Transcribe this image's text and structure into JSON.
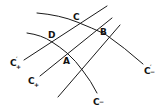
{
  "diagram": {
    "stroke_color": "#1a1a1a",
    "background": "#ffffff",
    "points": [
      {
        "id": "C",
        "label": "C"
      },
      {
        "id": "B",
        "label": "B"
      },
      {
        "id": "D",
        "label": "D"
      },
      {
        "id": "A",
        "label": "A"
      }
    ],
    "curves": [
      {
        "id": "c-prime-plus",
        "label": "C",
        "prime": "′",
        "sub": "+"
      },
      {
        "id": "c-plus",
        "label": "C",
        "prime": "",
        "sub": "+"
      },
      {
        "id": "c-prime-minus",
        "label": "C",
        "prime": "′",
        "sub": "−"
      },
      {
        "id": "c-minus",
        "label": "C",
        "prime": "",
        "sub": "−"
      }
    ]
  }
}
